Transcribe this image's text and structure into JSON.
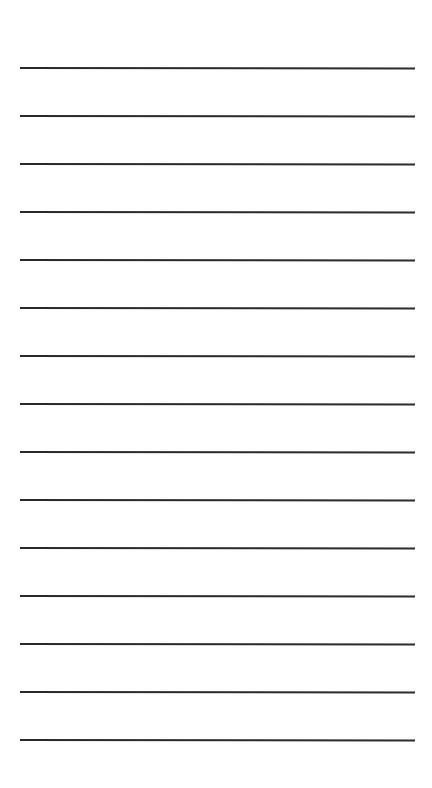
{
  "page": {
    "type": "lined-paper",
    "background_color": "#ffffff",
    "line_color": "#2a2a2a",
    "line_count": 15,
    "line_spacing_px": 48,
    "first_line_y_px": 67,
    "line_left_px": 20,
    "line_width_px": 395,
    "lines": [
      {
        "y": 67,
        "text": ""
      },
      {
        "y": 115,
        "text": ""
      },
      {
        "y": 163,
        "text": ""
      },
      {
        "y": 211,
        "text": ""
      },
      {
        "y": 259,
        "text": ""
      },
      {
        "y": 307,
        "text": ""
      },
      {
        "y": 355,
        "text": ""
      },
      {
        "y": 403,
        "text": ""
      },
      {
        "y": 451,
        "text": ""
      },
      {
        "y": 499,
        "text": ""
      },
      {
        "y": 547,
        "text": ""
      },
      {
        "y": 595,
        "text": ""
      },
      {
        "y": 643,
        "text": ""
      },
      {
        "y": 691,
        "text": ""
      },
      {
        "y": 739,
        "text": ""
      }
    ]
  }
}
